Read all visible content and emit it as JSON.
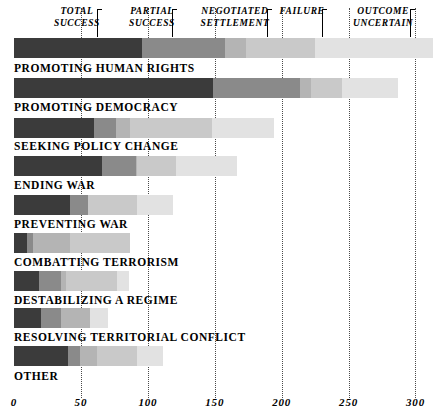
{
  "chart_data": {
    "type": "bar",
    "orientation": "horizontal",
    "stacked": true,
    "title": "",
    "subtitle": "",
    "xlabel": "",
    "ylabel": "",
    "xlim": [
      0,
      312
    ],
    "xticks": [
      0,
      50,
      100,
      150,
      200,
      250,
      300
    ],
    "xticklabels": [
      "0",
      "50",
      "100",
      "150",
      "200",
      "250",
      "300"
    ],
    "grid": true,
    "grid_axis": "x",
    "grid_style": "dotted",
    "legend_position": "top",
    "legend": [
      {
        "label": "TOTAL SUCCESS",
        "line1": "TOTAL",
        "line2": "SUCCESS",
        "color": "#3b3b3b"
      },
      {
        "label": "PARTIAL SUCCESS",
        "line1": "PARTIAL",
        "line2": "SUCCESS",
        "color": "#8a8a8a"
      },
      {
        "label": "NEGOTIATED SETTLEMENT",
        "line1": "NEGOTIATED",
        "line2": "SETTLEMENT",
        "color": "#b4b4b4"
      },
      {
        "label": "FAILURE",
        "line1": "FAILURE",
        "line2": "",
        "color": "#c9c9c9"
      },
      {
        "label": "OUTCOME UNCERTAIN",
        "line1": "OUTCOME",
        "line2": "UNCERTAIN",
        "color": "#e2e2e2"
      }
    ],
    "legend_bar_segments": [
      96,
      62,
      15,
      52,
      88
    ],
    "categories": [
      "PROMOTING HUMAN RIGHTS",
      "PROMOTING DEMOCRACY",
      "SEEKING POLICY CHANGE",
      "ENDING WAR",
      "PREVENTING WAR",
      "COMBATTING TERRORISM",
      "DESTABILIZING A REGIME",
      "RESOLVING TERRITORIAL CONFLICT",
      "OTHER"
    ],
    "series": [
      {
        "name": "TOTAL SUCCESS",
        "values": [
          96,
          149,
          60,
          66,
          42,
          10,
          19,
          20,
          40
        ]
      },
      {
        "name": "PARTIAL SUCCESS",
        "values": [
          62,
          65,
          16,
          25,
          13,
          4,
          16,
          15,
          9
        ]
      },
      {
        "name": "NEGOTIATED SETTLEMENT",
        "values": [
          15,
          8,
          11,
          1,
          0,
          28,
          4,
          22,
          13
        ]
      },
      {
        "name": "FAILURE",
        "values": [
          52,
          23,
          61,
          29,
          37,
          45,
          38,
          0,
          30
        ]
      },
      {
        "name": "OUTCOME UNCERTAIN",
        "values": [
          88,
          42,
          46,
          46,
          27,
          0,
          9,
          13,
          19
        ]
      }
    ],
    "row_totals": [
      313,
      287,
      194,
      167,
      119,
      87,
      86,
      70,
      111
    ]
  }
}
